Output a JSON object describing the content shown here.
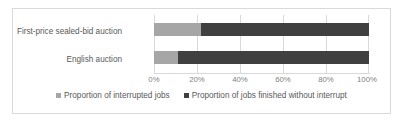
{
  "chart_data": {
    "type": "bar",
    "title": "",
    "xlabel": "",
    "ylabel": "",
    "orientation": "horizontal",
    "stacked": true,
    "normalized_percent": true,
    "grid": true,
    "legend_position": "bottom",
    "xlim": [
      0,
      100
    ],
    "categories": [
      "First-price sealed-bid auction",
      "English auction"
    ],
    "tick_labels": [
      "0%",
      "20%",
      "40%",
      "60%",
      "80%",
      "100%"
    ],
    "tick_values": [
      0,
      20,
      40,
      60,
      80,
      100
    ],
    "series": [
      {
        "name": "Proportion of interrupted jobs",
        "color": "#a6a6a6",
        "values": [
          22,
          11
        ]
      },
      {
        "name": "Proportion of jobs finished without interrupt",
        "color": "#404040",
        "values": [
          78,
          89
        ]
      }
    ]
  },
  "legend": {
    "items": [
      {
        "label": "Proportion of interrupted jobs"
      },
      {
        "label": "Proportion of jobs finished without interrupt"
      }
    ]
  },
  "colors": {
    "series_light": "#a6a6a6",
    "series_dark": "#404040",
    "gridline": "#d9d9d9",
    "border": "#d9d9d9",
    "text": "#595959",
    "tick_text": "#7f7f7f"
  }
}
